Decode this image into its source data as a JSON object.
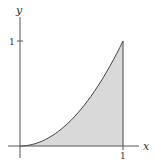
{
  "diagram": {
    "type": "area-under-curve",
    "function": "y = x^2",
    "interval": [
      0,
      1
    ],
    "axes": {
      "x_label": "x",
      "y_label": "y",
      "x_ticks": [
        "1"
      ],
      "y_ticks": [
        "1"
      ]
    },
    "colors": {
      "fill": "#d9d9d9",
      "curve": "#444444",
      "axis": "#555555"
    }
  }
}
